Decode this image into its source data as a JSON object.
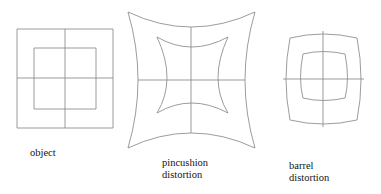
{
  "figure": {
    "kind": "optical-distortion-diagram",
    "background_color": "#ffffff",
    "line_color": "#8a8a8a",
    "text_color": "#141414",
    "panels": [
      {
        "id": "object",
        "caption": "object",
        "caption_lines": [
          "object"
        ],
        "description": "undistorted reference: square outer border, square inner border, straight horizontal and vertical center lines",
        "distortion": "none",
        "outer_bounds": {
          "x": 17,
          "y": 29,
          "width": 96,
          "height": 99
        },
        "inner_bounds": {
          "x": 34,
          "y": 48,
          "width": 62,
          "height": 61
        },
        "center": {
          "x": 65,
          "y": 78
        }
      },
      {
        "id": "pincushion",
        "caption": "pincushion distortion",
        "caption_lines": [
          "pincushion",
          "distortion"
        ],
        "description": "edges bow inward toward the center; corners stretched outward",
        "distortion": "pincushion",
        "outer_bounds": {
          "x": 128,
          "y": 12,
          "width": 127,
          "height": 136
        },
        "inner_bounds": {
          "x": 157,
          "y": 37,
          "width": 71,
          "height": 76
        },
        "center": {
          "x": 191,
          "y": 80
        },
        "outer_bow_px": 20,
        "inner_bow_px": 10
      },
      {
        "id": "barrel",
        "caption": "barrel distortion",
        "caption_lines": [
          "barrel",
          "distortion"
        ],
        "description": "edges bulge outward away from the center; corners pulled inward",
        "distortion": "barrel",
        "outer_bounds": {
          "x": 284,
          "y": 35,
          "width": 79,
          "height": 88
        },
        "inner_bounds": {
          "x": 300,
          "y": 52,
          "width": 48,
          "height": 48
        },
        "center": {
          "x": 323,
          "y": 79
        },
        "outer_bow_px": 9,
        "inner_bow_px": 5
      }
    ]
  }
}
